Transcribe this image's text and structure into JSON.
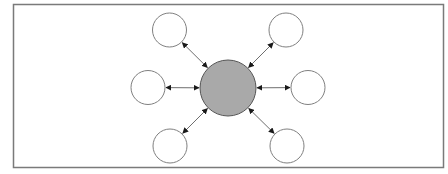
{
  "diagram": {
    "type": "hub-and-spoke",
    "canvas": {
      "width": 448,
      "height": 174,
      "background": "#ffffff"
    },
    "frame": {
      "x": 13.5,
      "y": 4.5,
      "width": 430,
      "height": 163,
      "stroke": "#7a7a7a",
      "stroke_width": 1.5,
      "fill": "#ffffff"
    },
    "hub": {
      "id": "hub",
      "cx": 228,
      "cy": 88,
      "r": 28,
      "fill": "#a9a9a9",
      "stroke": "#555555",
      "stroke_width": 1
    },
    "nodes": [
      {
        "id": "node-top-left",
        "cx": 169.5,
        "cy": 30,
        "r": 17,
        "fill": "#ffffff",
        "stroke": "#808080",
        "stroke_width": 1
      },
      {
        "id": "node-top-right",
        "cx": 286,
        "cy": 30,
        "r": 17,
        "fill": "#ffffff",
        "stroke": "#808080",
        "stroke_width": 1
      },
      {
        "id": "node-left",
        "cx": 148,
        "cy": 87.5,
        "r": 17,
        "fill": "#ffffff",
        "stroke": "#808080",
        "stroke_width": 1
      },
      {
        "id": "node-right",
        "cx": 308,
        "cy": 87.5,
        "r": 17,
        "fill": "#ffffff",
        "stroke": "#808080",
        "stroke_width": 1
      },
      {
        "id": "node-bottom-left",
        "cx": 170,
        "cy": 146,
        "r": 17,
        "fill": "#ffffff",
        "stroke": "#808080",
        "stroke_width": 1
      },
      {
        "id": "node-bottom-right",
        "cx": 287,
        "cy": 146,
        "r": 17,
        "fill": "#ffffff",
        "stroke": "#808080",
        "stroke_width": 1
      }
    ],
    "edges": [
      {
        "from": "hub",
        "to": "node-top-left",
        "direction": "bidirectional"
      },
      {
        "from": "hub",
        "to": "node-top-right",
        "direction": "bidirectional"
      },
      {
        "from": "hub",
        "to": "node-left",
        "direction": "bidirectional"
      },
      {
        "from": "hub",
        "to": "node-right",
        "direction": "bidirectional"
      },
      {
        "from": "hub",
        "to": "node-bottom-left",
        "direction": "bidirectional"
      },
      {
        "from": "hub",
        "to": "node-bottom-right",
        "direction": "bidirectional"
      }
    ],
    "edge_style": {
      "stroke": "#6e6e6e",
      "stroke_width": 1,
      "arrowhead_color": "#1a1a1a",
      "arrowhead_size": 6,
      "gap": 1
    }
  }
}
